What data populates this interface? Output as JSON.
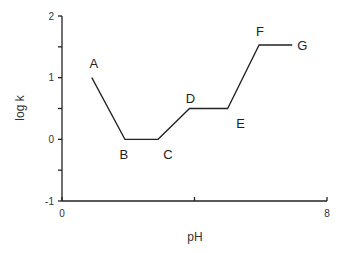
{
  "chart_data": {
    "type": "line",
    "title": "",
    "xlabel": "pH",
    "ylabel": "log k",
    "xlim": [
      0,
      8
    ],
    "ylim": [
      -1,
      2
    ],
    "x_ticks": [
      0,
      4,
      8
    ],
    "x_tick_labels": [
      "0",
      "",
      "8"
    ],
    "y_ticks": [
      -1,
      -0.5,
      0,
      0.5,
      1,
      1.5,
      2
    ],
    "y_tick_labels": [
      "-1",
      "",
      "0",
      "",
      "1",
      "",
      "2"
    ],
    "grid": false,
    "legend": null,
    "series": [
      {
        "name": "log k vs pH",
        "points": [
          {
            "label": "A",
            "x": 0.9,
            "y": 1.0
          },
          {
            "label": "B",
            "x": 1.9,
            "y": 0.0
          },
          {
            "label": "C",
            "x": 2.9,
            "y": 0.0
          },
          {
            "label": "D",
            "x": 3.85,
            "y": 0.5
          },
          {
            "label": "E",
            "x": 5.0,
            "y": 0.5
          },
          {
            "label": "F",
            "x": 5.95,
            "y": 1.53
          },
          {
            "label": "G",
            "x": 6.95,
            "y": 1.53
          }
        ]
      }
    ],
    "annotations": [
      "A",
      "B",
      "C",
      "D",
      "E",
      "F",
      "G"
    ]
  },
  "colors": {
    "line": "#222222",
    "text": "#333333",
    "background": "#ffffff"
  }
}
